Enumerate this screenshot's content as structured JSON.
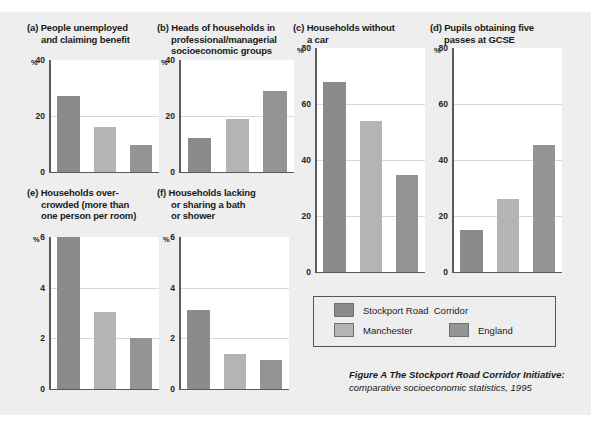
{
  "figure": {
    "caption_line1": "Figure A The Stockport Road Corridor Initiative:",
    "caption_line2": "comparative socioeconomic statistics, 1995",
    "background_color": "#eeeeee"
  },
  "legend": {
    "entries": [
      {
        "label": "Stockport Road  Corridor",
        "color": "#8b8b8b"
      },
      {
        "label": "Manchester",
        "color": "#b4b4b4"
      },
      {
        "label": "England",
        "color": "#949494"
      }
    ]
  },
  "chart_data": [
    {
      "type": "bar",
      "panel": "a",
      "title": "(a) People unemployed\nand claiming benefit",
      "unit_label": "%",
      "categories": [
        "Stockport Road Corridor",
        "Manchester",
        "England"
      ],
      "values": [
        27,
        16,
        9.5
      ],
      "ylim": [
        0,
        40
      ],
      "yticks": [
        0,
        20,
        40
      ],
      "ytick_labels": [
        "0",
        "20",
        "40"
      ],
      "ylabel": "%",
      "xlabel": "",
      "grid": true,
      "legend_position": "external"
    },
    {
      "type": "bar",
      "panel": "b",
      "title": "(b) Heads of households in\nprofessional/managerial\nsocioeconomic groups",
      "unit_label": "%",
      "categories": [
        "Stockport Road Corridor",
        "Manchester",
        "England"
      ],
      "values": [
        12,
        19,
        29
      ],
      "ylim": [
        0,
        40
      ],
      "yticks": [
        0,
        20,
        40
      ],
      "ytick_labels": [
        "0",
        "20",
        "40"
      ],
      "ylabel": "%",
      "xlabel": "",
      "grid": true,
      "legend_position": "external"
    },
    {
      "type": "bar",
      "panel": "c",
      "title": "(c) Households without\na car",
      "unit_label": "%",
      "categories": [
        "Stockport Road Corridor",
        "Manchester",
        "England"
      ],
      "values": [
        68,
        54,
        34.5
      ],
      "ylim": [
        0,
        80
      ],
      "yticks": [
        0,
        20,
        40,
        60,
        80
      ],
      "ytick_labels": [
        "0",
        "20",
        "40",
        "60",
        "80"
      ],
      "ylabel": "%",
      "xlabel": "",
      "grid": true,
      "legend_position": "external"
    },
    {
      "type": "bar",
      "panel": "d",
      "title": "(d) Pupils obtaining five\npasses at GCSE",
      "unit_label": "%",
      "categories": [
        "Stockport Road Corridor",
        "Manchester",
        "England"
      ],
      "values": [
        15,
        26,
        45.5
      ],
      "ylim": [
        0,
        80
      ],
      "yticks": [
        0,
        20,
        40,
        60,
        80
      ],
      "ytick_labels": [
        "0",
        "20",
        "40",
        "60",
        "80"
      ],
      "ylabel": "%",
      "xlabel": "",
      "grid": true,
      "legend_position": "external"
    },
    {
      "type": "bar",
      "panel": "e",
      "title": "(e) Households over-\ncrowded (more than\none person per room)",
      "unit_label": "%",
      "categories": [
        "Stockport Road Corridor",
        "Manchester",
        "England"
      ],
      "values": [
        6.0,
        3.05,
        2.0
      ],
      "ylim": [
        0,
        6
      ],
      "yticks": [
        0,
        2,
        4,
        6
      ],
      "ytick_labels": [
        "0",
        "2",
        "4",
        "6"
      ],
      "ylabel": "%",
      "xlabel": "",
      "grid": true,
      "legend_position": "external"
    },
    {
      "type": "bar",
      "panel": "f",
      "title": "(f) Households lacking\nor sharing a bath\nor shower",
      "unit_label": "%",
      "categories": [
        "Stockport Road Corridor",
        "Manchester",
        "England"
      ],
      "values": [
        3.1,
        1.4,
        1.15
      ],
      "ylim": [
        0,
        6
      ],
      "yticks": [
        0,
        2,
        4,
        6
      ],
      "ytick_labels": [
        "0",
        "2",
        "4",
        "6"
      ],
      "ylabel": "%",
      "xlabel": "",
      "grid": true,
      "legend_position": "external"
    }
  ]
}
